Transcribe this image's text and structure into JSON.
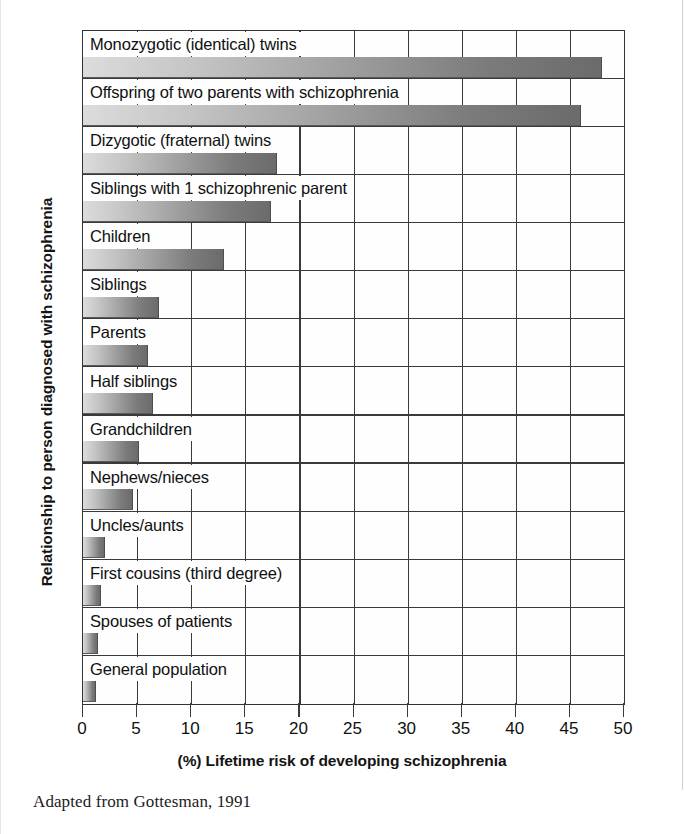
{
  "figure": {
    "source_note": "Adapted from Gottesman, 1991"
  },
  "chart_data": {
    "type": "bar",
    "orientation": "horizontal",
    "title": "",
    "xlabel": "(%) Lifetime risk of developing schizophrenia",
    "ylabel": "Relationship to person diagnosed with schizophrenia",
    "xlim": [
      0,
      50
    ],
    "xticks": [
      0,
      5,
      10,
      15,
      20,
      25,
      30,
      35,
      40,
      45,
      50
    ],
    "xtick_labels": [
      "0",
      "5",
      "10",
      "15",
      "20",
      "25",
      "30",
      "35",
      "40",
      "45",
      "50"
    ],
    "grid": true,
    "grid_axis": "x",
    "legend": false,
    "bar_fill": "gradient-light-to-dark-gray",
    "bar_color_start": "#dcdcdc",
    "bar_color_end": "#6b6b6b",
    "categories": [
      "Monozygotic (identical) twins",
      "Offspring of two parents with schizophrenia",
      "Dizygotic (fraternal) twins",
      "Siblings with 1 schizophrenic parent",
      "Children",
      "Siblings",
      "Parents",
      "Half siblings",
      "Grandchildren",
      "Nephews/nieces",
      "Uncles/aunts",
      "First cousins (third degree)",
      "Spouses of patients",
      "General population"
    ],
    "values": [
      48,
      46,
      17.9,
      17.4,
      13,
      7,
      6,
      6.5,
      5.2,
      4.6,
      2,
      1.7,
      1.4,
      1.2
    ]
  }
}
